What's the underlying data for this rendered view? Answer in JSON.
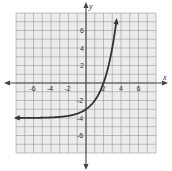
{
  "chart_data": {
    "type": "line",
    "title": "",
    "xlabel": "x",
    "ylabel": "y",
    "xlim": [
      -8,
      8
    ],
    "ylim": [
      -8,
      8
    ],
    "grid": true,
    "x_ticks": [
      -6,
      -4,
      -2,
      2,
      4,
      6
    ],
    "y_ticks": [
      6,
      4,
      2,
      -2,
      -4,
      -6
    ],
    "x_tick_labels": [
      "-6",
      "-4",
      "-2",
      "2",
      "4",
      "6"
    ],
    "y_tick_labels": [
      "6",
      "4",
      "2",
      "-2",
      "-4",
      "-6"
    ],
    "series": [
      {
        "name": "y = 2^x - 4",
        "function": "2^x - 4",
        "asymptote_y": -4,
        "y_intercept": -3,
        "x_intercept": 2,
        "x": [
          -8,
          -6,
          -4,
          -2,
          -1,
          0,
          1,
          2,
          3,
          3.5
        ],
        "y": [
          -3.996,
          -3.984,
          -3.938,
          -3.75,
          -3.5,
          -3,
          -2,
          0,
          4,
          7.31
        ],
        "arrows": [
          "left",
          "top"
        ]
      }
    ],
    "colors": {
      "curve": "#333333",
      "axes": "#444444",
      "grid": "#9a9a9a",
      "grid_background": "#ececec"
    }
  }
}
